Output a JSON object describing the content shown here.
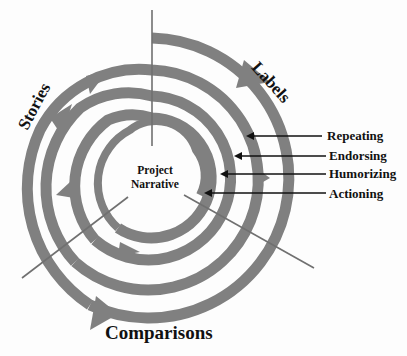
{
  "diagram": {
    "center_label_line1": "Project",
    "center_label_line2": "Narrative",
    "axes": {
      "top_right": "Labels",
      "top_left": "Stories",
      "bottom": "Comparisons"
    },
    "ring_labels": [
      "Repeating",
      "Endorsing",
      "Humorizing",
      "Actioning"
    ],
    "colors": {
      "spiral": "#808080",
      "text": "#111111",
      "line": "#707070",
      "background": "#ffffff"
    }
  }
}
